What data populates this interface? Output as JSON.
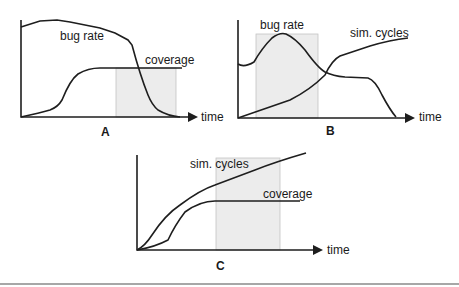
{
  "panels": {
    "A": {
      "label": "A",
      "x_axis": "time",
      "curves": [
        "bug rate",
        "coverage"
      ],
      "shaded_region": "late stage where coverage plateaus"
    },
    "B": {
      "label": "B",
      "x_axis": "time",
      "curves": [
        "bug rate",
        "sim. cycles"
      ],
      "shaded_region": "early stage around bug rate peak"
    },
    "C": {
      "label": "C",
      "x_axis": "time",
      "curves": [
        "sim. cycles",
        "coverage"
      ],
      "shaded_region": "late stage where coverage plateaus while sim. cycles rise"
    }
  },
  "colors": {
    "line": "#1e1e1e",
    "shade": "#ececec",
    "divider": "#8a8a8a"
  }
}
